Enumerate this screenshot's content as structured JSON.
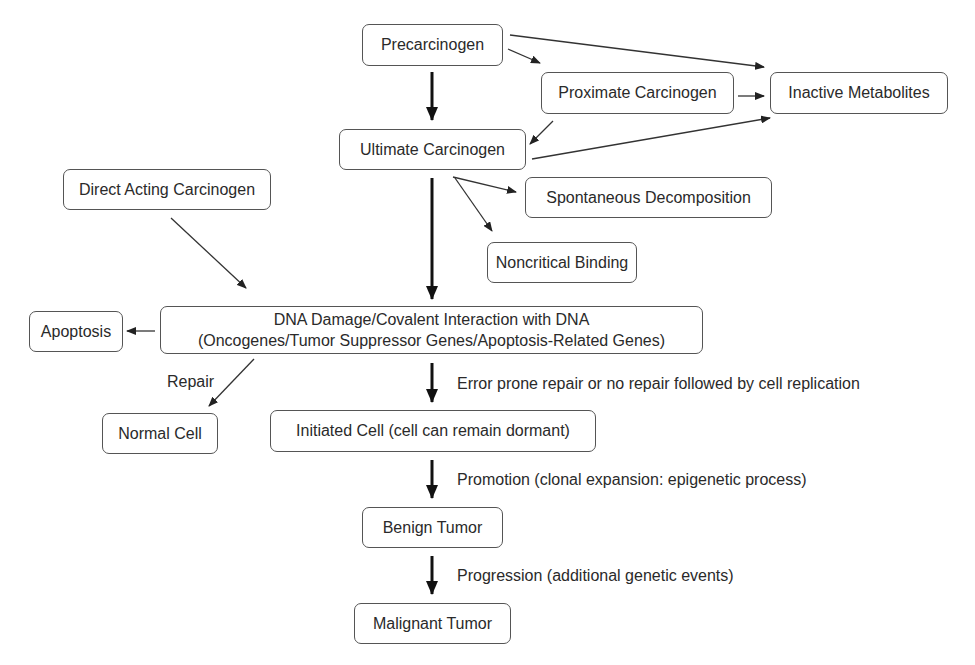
{
  "diagram": {
    "nodes": {
      "precarcinogen": "Precarcinogen",
      "proximate": "Proximate Carcinogen",
      "inactive": "Inactive Metabolites",
      "ultimate": "Ultimate Carcinogen",
      "direct": "Direct Acting Carcinogen",
      "spontaneous": "Spontaneous Decomposition",
      "noncritical": "Noncritical Binding",
      "dna_line1": "DNA Damage/Covalent Interaction with DNA",
      "dna_line2": "(Oncogenes/Tumor Suppressor Genes/Apoptosis-Related Genes)",
      "apoptosis": "Apoptosis",
      "normal": "Normal Cell",
      "initiated": "Initiated Cell (cell can remain dormant)",
      "benign": "Benign Tumor",
      "malignant": "Malignant Tumor"
    },
    "edge_labels": {
      "repair": "Repair",
      "error_prone": "Error prone repair or no repair followed by cell replication",
      "promotion": "Promotion (clonal expansion: epigenetic process)",
      "progression": "Progression (additional genetic events)"
    },
    "edges": [
      {
        "from": "precarcinogen",
        "to": "ultimate",
        "style": "bold"
      },
      {
        "from": "precarcinogen",
        "to": "proximate",
        "style": "thin"
      },
      {
        "from": "precarcinogen",
        "to": "inactive",
        "style": "thin"
      },
      {
        "from": "proximate",
        "to": "inactive",
        "style": "thin"
      },
      {
        "from": "proximate",
        "to": "ultimate",
        "style": "thin"
      },
      {
        "from": "ultimate",
        "to": "inactive",
        "style": "thin"
      },
      {
        "from": "ultimate",
        "to": "spontaneous",
        "style": "thin"
      },
      {
        "from": "ultimate",
        "to": "noncritical",
        "style": "thin"
      },
      {
        "from": "ultimate",
        "to": "dna",
        "style": "bold"
      },
      {
        "from": "direct",
        "to": "dna",
        "style": "thin"
      },
      {
        "from": "dna",
        "to": "apoptosis",
        "style": "thin"
      },
      {
        "from": "dna",
        "to": "normal",
        "style": "thin",
        "label": "repair"
      },
      {
        "from": "dna",
        "to": "initiated",
        "style": "bold",
        "label": "error_prone"
      },
      {
        "from": "initiated",
        "to": "benign",
        "style": "bold",
        "label": "promotion"
      },
      {
        "from": "benign",
        "to": "malignant",
        "style": "bold",
        "label": "progression"
      }
    ],
    "colors": {
      "stroke": "#555555",
      "text": "#2a2a2a",
      "arrow": "#222222",
      "background": "#ffffff"
    }
  }
}
